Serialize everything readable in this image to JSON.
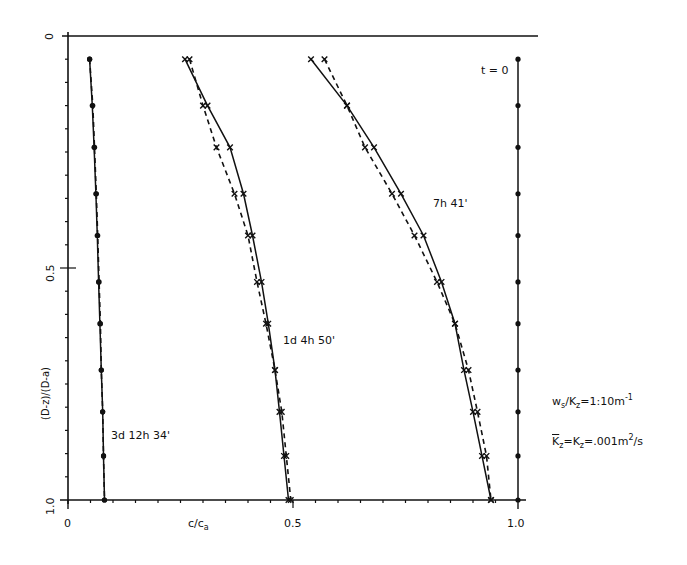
{
  "chart_data": {
    "type": "line",
    "title": "",
    "xlabel": "c/c_a",
    "ylabel": "(D-z)/(D-a)",
    "xlim": [
      0,
      1.0
    ],
    "ylim": [
      1.0,
      0
    ],
    "y_inverted": true,
    "grid": false,
    "x_ticks": [
      "0",
      "0.5",
      "1.0"
    ],
    "y_ticks": [
      "0",
      "0.5",
      "1.0"
    ],
    "y_positions": [
      0.05,
      0.15,
      0.24,
      0.34,
      0.43,
      0.53,
      0.62,
      0.72,
      0.81,
      0.905,
      1.0
    ],
    "series": [
      {
        "name": "t = 0",
        "style": "solid",
        "marker": "dot",
        "x": [
          1.0,
          1.0,
          1.0,
          1.0,
          1.0,
          1.0,
          1.0,
          1.0,
          1.0,
          1.0,
          1.0
        ]
      },
      {
        "name": "7h 41' (solid)",
        "style": "solid",
        "marker": "x",
        "x": [
          0.54,
          0.62,
          0.68,
          0.74,
          0.79,
          0.83,
          0.86,
          0.88,
          0.9,
          0.92,
          0.94
        ]
      },
      {
        "name": "7h 41' (dashed)",
        "style": "dashed",
        "marker": "x",
        "x": [
          0.57,
          0.62,
          0.66,
          0.72,
          0.77,
          0.82,
          0.86,
          0.89,
          0.91,
          0.93,
          0.94
        ]
      },
      {
        "name": "1d 4h 50' (solid)",
        "style": "solid",
        "marker": "x",
        "x": [
          0.26,
          0.31,
          0.36,
          0.39,
          0.41,
          0.43,
          0.445,
          0.46,
          0.47,
          0.48,
          0.49
        ]
      },
      {
        "name": "1d 4h 50' (dashed)",
        "style": "dashed",
        "marker": "x",
        "x": [
          0.27,
          0.3,
          0.33,
          0.37,
          0.4,
          0.42,
          0.44,
          0.46,
          0.475,
          0.485,
          0.495
        ]
      },
      {
        "name": "3d 12h 34' (solid)",
        "style": "solid",
        "marker": "dot",
        "x": [
          0.048,
          0.054,
          0.058,
          0.062,
          0.065,
          0.068,
          0.071,
          0.074,
          0.077,
          0.079,
          0.081
        ]
      },
      {
        "name": "3d 12h 34' (dashed)",
        "style": "dashed",
        "marker": "dot",
        "x": [
          0.048,
          0.055,
          0.059,
          0.063,
          0.066,
          0.069,
          0.072,
          0.074,
          0.077,
          0.079,
          0.081
        ]
      }
    ],
    "annotations": [
      "t = 0",
      "7h 41'",
      "1d 4h 50'",
      "3d 12h 34'",
      "w_s/K_z=1:10m^-1",
      "K̄_z=K_z=.001m^2/s"
    ]
  },
  "labels": {
    "x_tick_0": "0",
    "x_tick_05": "0.5",
    "x_tick_10": "1.0",
    "y_tick_0": "0",
    "y_tick_05": "0.5",
    "y_tick_10": "1.0",
    "xlabel_main": "c/c",
    "xlabel_sub": "a",
    "ylabel": "(D-z)/(D-a)",
    "t0": "t = 0",
    "curve_7h": "7h 41'",
    "curve_1d": "1d 4h 50'",
    "curve_3d": "3d 12h 34'",
    "param1_w": "w",
    "param1_w_sub": "s",
    "param1_mid": "/K",
    "param1_k_sub": "z",
    "param1_val": "=1:10m",
    "param1_sup": "-1",
    "param2_k": "K",
    "param2_k_sub": "z",
    "param2_mid": "=K",
    "param2_k2_sub": "z",
    "param2_val": "=.001m",
    "param2_sup": "2",
    "param2_tail": "/s"
  }
}
